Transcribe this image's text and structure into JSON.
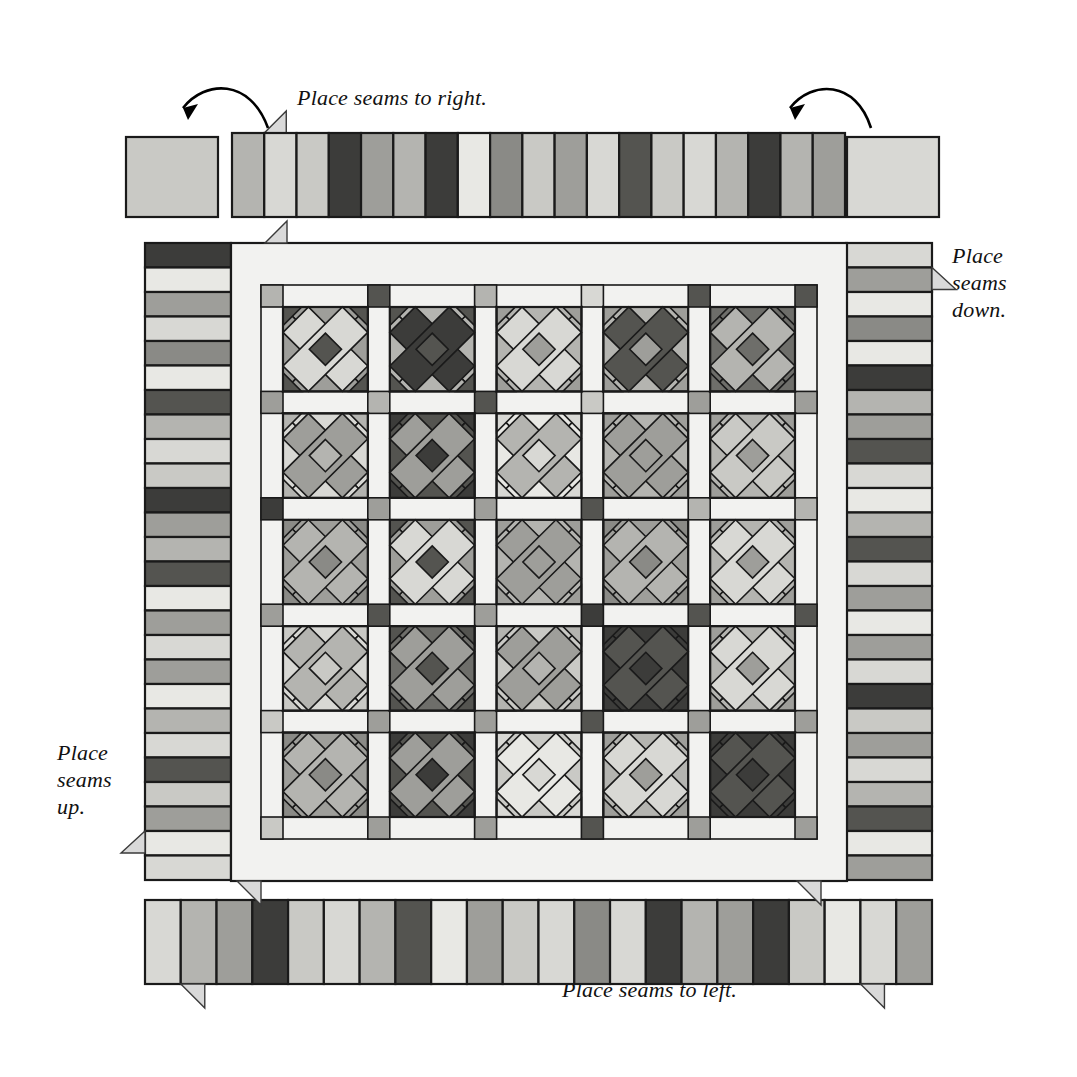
{
  "labels": {
    "top": "Place seams to right.",
    "right": "Place\nseams\ndown.",
    "right_line1": "Place",
    "right_line2": "seams",
    "right_line3": "down.",
    "left_line1": "Place",
    "left_line2": "seams",
    "left_line3": "up.",
    "bottom": "Place seams to left."
  },
  "palette": {
    "white": "#f2f2f0",
    "offwhite": "#e8e8e4",
    "light": "#d8d8d4",
    "lightgray": "#c9c9c5",
    "midlight": "#b4b4b0",
    "mid": "#9e9e9a",
    "middark": "#8a8a86",
    "dark": "#6e6e6a",
    "darker": "#545450",
    "darkest": "#3c3c3a",
    "outline": "#1a1a1a",
    "paper": "#ffffff"
  },
  "top_border": {
    "corner_left_square": "lightgray",
    "corner_right_square": "light",
    "seam_tab_after_segment": 1,
    "segments": [
      "midlight",
      "light",
      "lightgray",
      "darkest",
      "mid",
      "midlight",
      "darkest",
      "offwhite",
      "middark",
      "lightgray",
      "mid",
      "light",
      "darker",
      "lightgray",
      "light",
      "midlight",
      "darkest",
      "midlight",
      "mid"
    ]
  },
  "bottom_border": {
    "segments": [
      "light",
      "midlight",
      "mid",
      "darkest",
      "lightgray",
      "light",
      "midlight",
      "darker",
      "offwhite",
      "mid",
      "lightgray",
      "light",
      "middark",
      "light",
      "darkest",
      "midlight",
      "mid",
      "darkest",
      "lightgray",
      "offwhite",
      "light",
      "mid"
    ],
    "seam_tab_after_segment": 1,
    "seam_tab2_after_segment": 20
  },
  "left_border": {
    "segments": [
      "darkest",
      "offwhite",
      "mid",
      "light",
      "middark",
      "offwhite",
      "darker",
      "midlight",
      "light",
      "lightgray",
      "darkest",
      "mid",
      "midlight",
      "darker",
      "offwhite",
      "mid",
      "light",
      "mid",
      "offwhite",
      "midlight",
      "light",
      "darker",
      "lightgray",
      "mid",
      "offwhite",
      "light"
    ],
    "seam_tab_near_bottom": true
  },
  "right_border": {
    "segments": [
      "light",
      "mid",
      "offwhite",
      "middark",
      "offwhite",
      "darkest",
      "midlight",
      "mid",
      "darker",
      "light",
      "offwhite",
      "midlight",
      "darker",
      "light",
      "mid",
      "offwhite",
      "mid",
      "light",
      "darkest",
      "lightgray",
      "mid",
      "light",
      "midlight",
      "darker",
      "offwhite",
      "mid"
    ],
    "seam_tab_near_top": true
  },
  "center": {
    "rows": 5,
    "cols": 5,
    "sashing_color": "white",
    "block_pattern": "x-block",
    "blocks": [
      [
        {
          "main": "mid",
          "accent": "light",
          "corner": "darker"
        },
        {
          "main": "midlight",
          "accent": "darkest",
          "corner": "darker"
        },
        {
          "main": "midlight",
          "accent": "light",
          "corner": "mid"
        },
        {
          "main": "midlight",
          "accent": "darker",
          "corner": "mid"
        },
        {
          "main": "dark",
          "accent": "midlight",
          "corner": "dark"
        }
      ],
      [
        {
          "main": "light",
          "accent": "mid",
          "corner": "midlight"
        },
        {
          "main": "darker",
          "accent": "mid",
          "corner": "darkest"
        },
        {
          "main": "offwhite",
          "accent": "midlight",
          "corner": "light"
        },
        {
          "main": "midlight",
          "accent": "mid",
          "corner": "mid"
        },
        {
          "main": "midlight",
          "accent": "lightgray",
          "corner": "mid"
        }
      ],
      [
        {
          "main": "mid",
          "accent": "midlight",
          "corner": "middark"
        },
        {
          "main": "mid",
          "accent": "light",
          "corner": "darker"
        },
        {
          "main": "midlight",
          "accent": "mid",
          "corner": "mid"
        },
        {
          "main": "mid",
          "accent": "midlight",
          "corner": "middark"
        },
        {
          "main": "midlight",
          "accent": "light",
          "corner": "mid"
        }
      ],
      [
        {
          "main": "light",
          "accent": "midlight",
          "corner": "lightgray"
        },
        {
          "main": "dark",
          "accent": "mid",
          "corner": "darker"
        },
        {
          "main": "lightgray",
          "accent": "mid",
          "corner": "midlight"
        },
        {
          "main": "darkest",
          "accent": "darker",
          "corner": "darkest"
        },
        {
          "main": "midlight",
          "accent": "light",
          "corner": "mid"
        }
      ],
      [
        {
          "main": "mid",
          "accent": "midlight",
          "corner": "middark"
        },
        {
          "main": "darker",
          "accent": "mid",
          "corner": "darkest"
        },
        {
          "main": "lightgray",
          "accent": "offwhite",
          "corner": "light"
        },
        {
          "main": "midlight",
          "accent": "light",
          "corner": "mid"
        },
        {
          "main": "darkest",
          "accent": "darker",
          "corner": "darkest"
        }
      ]
    ],
    "cornerstones": [
      [
        "midlight",
        "darker",
        "midlight",
        "light",
        "darker"
      ],
      [
        "mid",
        "midlight",
        "darker",
        "lightgray",
        "mid"
      ],
      [
        "darkest",
        "mid",
        "mid",
        "darker",
        "midlight"
      ],
      [
        "mid",
        "darker",
        "mid",
        "darkest",
        "darker"
      ],
      [
        "lightgray",
        "mid",
        "mid",
        "darker",
        "mid"
      ]
    ]
  },
  "arrows": {
    "left_arrow_label": "rotate-left-arrow",
    "right_arrow_label": "rotate-right-arrow",
    "count": 2
  }
}
